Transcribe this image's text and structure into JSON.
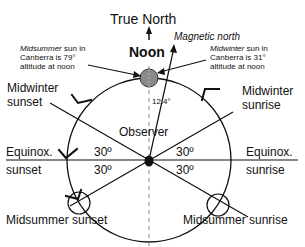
{
  "title": "True North",
  "noon_label": "Noon",
  "magnetic_label": "Magnetic north",
  "declination_label": "12.4°",
  "observer_label": "Observer",
  "midsummer_note": {
    "line1_italic": "Midsummer",
    "line1_rest": " sun in",
    "line2": "Canberra is 79°",
    "line3": "altitude at noon"
  },
  "midwinter_note": {
    "line1_italic": "Midwinter",
    "line1_rest": " sun in",
    "line2": "Canberra is 31°",
    "line3": "altitude at noon"
  },
  "labels": {
    "midwinter_sunset_1": "Midwinter",
    "midwinter_sunset_2": "sunset",
    "midwinter_sunrise_1": "Midwinter",
    "midwinter_sunrise_2": "sunrise",
    "equinox_sunset_1": "Equinox.",
    "equinox_sunset_2": "sunset",
    "equinox_sunrise_1": "Equinox.",
    "equinox_sunrise_2": "sunrise",
    "midsummer_sunset": "Midsummer sunset",
    "midsummer_sunrise": "Midsummer sunrise"
  },
  "angles": {
    "left_upper": "30º",
    "left_lower": "30º",
    "right_upper": "30º",
    "right_lower": "30º"
  },
  "colors": {
    "line": "#111111",
    "sun_fill": "#8a8a8a",
    "dash": "#888888"
  }
}
